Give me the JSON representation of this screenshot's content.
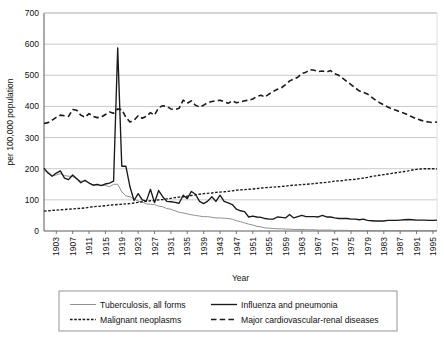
{
  "chart_data": {
    "type": "line",
    "title": "",
    "xlabel": "Year",
    "ylabel": "per 100,000 population",
    "xlim": [
      1900,
      1996
    ],
    "ylim": [
      0,
      700
    ],
    "ytick_step": 100,
    "yticks": [
      "0",
      "100",
      "200",
      "300",
      "400",
      "500",
      "600",
      "700"
    ],
    "xticks": [
      "1903",
      "1907",
      "1911",
      "1915",
      "1919",
      "1923",
      "1927",
      "1931",
      "1935",
      "1939",
      "1943",
      "1947",
      "1951",
      "1955",
      "1959",
      "1963",
      "1967",
      "1971",
      "1975",
      "1979",
      "1983",
      "1987",
      "1991",
      "1995"
    ],
    "grid": "horizontal",
    "legend_position": "bottom",
    "x": [
      1900,
      1901,
      1902,
      1903,
      1904,
      1905,
      1906,
      1907,
      1908,
      1909,
      1910,
      1911,
      1912,
      1913,
      1914,
      1915,
      1916,
      1917,
      1918,
      1919,
      1920,
      1921,
      1922,
      1923,
      1924,
      1925,
      1926,
      1927,
      1928,
      1929,
      1930,
      1931,
      1932,
      1933,
      1934,
      1935,
      1936,
      1937,
      1938,
      1939,
      1940,
      1941,
      1942,
      1943,
      1944,
      1945,
      1946,
      1947,
      1948,
      1949,
      1950,
      1951,
      1952,
      1953,
      1954,
      1955,
      1956,
      1957,
      1958,
      1959,
      1960,
      1961,
      1962,
      1963,
      1964,
      1965,
      1966,
      1967,
      1968,
      1969,
      1970,
      1971,
      1972,
      1973,
      1974,
      1975,
      1976,
      1977,
      1978,
      1979,
      1980,
      1981,
      1982,
      1983,
      1984,
      1985,
      1986,
      1987,
      1988,
      1989,
      1990,
      1991,
      1992,
      1993,
      1994,
      1995,
      1996
    ],
    "series": [
      {
        "name": "Tuberculosis, all forms",
        "style": "solid-thin",
        "color": "#8a8a8a",
        "values": [
          194,
          190,
          178,
          180,
          184,
          178,
          176,
          175,
          167,
          160,
          160,
          155,
          148,
          147,
          147,
          146,
          142,
          150,
          150,
          126,
          113,
          110,
          103,
          96,
          93,
          87,
          86,
          85,
          80,
          78,
          72,
          70,
          65,
          60,
          58,
          55,
          52,
          50,
          48,
          46,
          46,
          44,
          42,
          42,
          41,
          40,
          38,
          33,
          30,
          26,
          22,
          19,
          15,
          13,
          10,
          9,
          8,
          7,
          7,
          6,
          6,
          5,
          5,
          5,
          4,
          4,
          4,
          3,
          3,
          3,
          3,
          2,
          2,
          2,
          2,
          1,
          1,
          1,
          1,
          1,
          1,
          1,
          1,
          1,
          1,
          1,
          1,
          1,
          1,
          1,
          1,
          1,
          1,
          1,
          1,
          1,
          1
        ]
      },
      {
        "name": "Influenza and pneumonia",
        "style": "solid-bold",
        "color": "#1a1a1a",
        "values": [
          202,
          186,
          176,
          186,
          193,
          170,
          165,
          180,
          168,
          155,
          163,
          154,
          147,
          150,
          146,
          151,
          154,
          160,
          588,
          208,
          208,
          142,
          98,
          120,
          100,
          96,
          134,
          91,
          130,
          110,
          95,
          94,
          92,
          89,
          115,
          104,
          127,
          118,
          95,
          88,
          96,
          110,
          95,
          115,
          95,
          90,
          85,
          70,
          65,
          62,
          45,
          48,
          45,
          44,
          40,
          38,
          38,
          45,
          44,
          42,
          53,
          42,
          46,
          50,
          46,
          46,
          46,
          45,
          50,
          45,
          45,
          42,
          40,
          40,
          40,
          38,
          38,
          36,
          38,
          34,
          33,
          32,
          32,
          32,
          34,
          34,
          34,
          35,
          36,
          37,
          36,
          35,
          35,
          35,
          34,
          34,
          35
        ]
      },
      {
        "name": "Malignant neoplasms",
        "style": "dotted",
        "color": "#1a1a1a",
        "values": [
          64,
          65,
          66,
          67,
          68,
          69,
          70,
          71,
          72,
          73,
          74,
          76,
          78,
          79,
          80,
          81,
          83,
          84,
          85,
          86,
          87,
          88,
          90,
          92,
          94,
          95,
          97,
          98,
          100,
          101,
          103,
          105,
          107,
          109,
          110,
          112,
          114,
          116,
          118,
          120,
          121,
          122,
          124,
          125,
          126,
          127,
          129,
          131,
          132,
          133,
          134,
          135,
          136,
          138,
          139,
          140,
          141,
          142,
          143,
          144,
          146,
          147,
          148,
          149,
          150,
          151,
          152,
          154,
          155,
          156,
          158,
          160,
          161,
          162,
          164,
          165,
          166,
          168,
          170,
          172,
          175,
          177,
          179,
          181,
          183,
          185,
          187,
          189,
          191,
          193,
          196,
          198,
          199,
          200,
          200,
          200,
          199
        ]
      },
      {
        "name": "Major cardiovascular-renal diseases",
        "style": "dashed",
        "color": "#1a1a1a",
        "values": [
          345,
          348,
          356,
          365,
          372,
          370,
          368,
          390,
          388,
          372,
          365,
          377,
          368,
          364,
          366,
          374,
          382,
          378,
          392,
          390,
          365,
          350,
          356,
          370,
          362,
          368,
          380,
          372,
          396,
          402,
          400,
          392,
          390,
          394,
          420,
          410,
          418,
          404,
          398,
          404,
          412,
          416,
          418,
          420,
          415,
          410,
          418,
          412,
          414,
          418,
          420,
          424,
          432,
          436,
          430,
          440,
          448,
          455,
          460,
          470,
          482,
          488,
          494,
          506,
          510,
          518,
          516,
          512,
          514,
          510,
          515,
          505,
          500,
          490,
          480,
          470,
          460,
          450,
          445,
          440,
          430,
          420,
          412,
          405,
          398,
          392,
          388,
          382,
          378,
          372,
          366,
          360,
          356,
          352,
          350,
          348,
          350
        ]
      }
    ]
  },
  "legend": {
    "items": [
      {
        "label": "Tuberculosis, all forms",
        "style": "solid-thin"
      },
      {
        "label": "Influenza and pneumonia",
        "style": "solid-bold"
      },
      {
        "label": "Malignant neoplasms",
        "style": "dotted"
      },
      {
        "label": "Major cardiovascular-renal diseases",
        "style": "dashed"
      }
    ]
  }
}
